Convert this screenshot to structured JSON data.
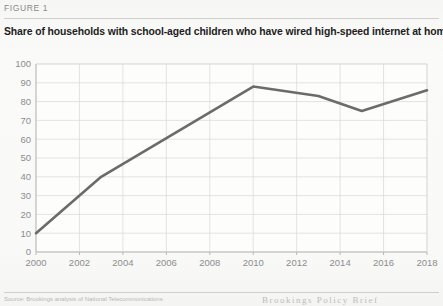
{
  "figure": {
    "label": "FIGURE 1",
    "title": "Share of households with school-aged children who have wired high-speed internet at home"
  },
  "footer": {
    "source": "Source: Brookings analysis of National Telecommunications",
    "brand": "Brookings Policy Brief"
  },
  "colors": {
    "line": "#6b6b6b",
    "grid": "#d9d9d9",
    "axis": "#b9b9b9",
    "tick_text": "#8d8d8d",
    "paper": "#f7f7f5",
    "title": "#1d1d1d"
  },
  "chart_data": {
    "type": "line",
    "title": "Share of households with school-aged children who have wired high-speed internet at home",
    "xlabel": "",
    "ylabel": "",
    "xlim": [
      2000,
      2018
    ],
    "ylim": [
      0,
      100
    ],
    "grid": true,
    "legend": "none",
    "x_ticks": [
      2000,
      2002,
      2004,
      2006,
      2008,
      2010,
      2012,
      2014,
      2016,
      2018
    ],
    "y_ticks": [
      0,
      10,
      20,
      30,
      40,
      50,
      60,
      70,
      80,
      90,
      100
    ],
    "series": [
      {
        "name": "Wired high-speed internet at home",
        "x": [
          2000,
          2003,
          2010,
          2013,
          2015,
          2018
        ],
        "values": [
          10,
          40,
          88,
          83,
          75,
          86
        ]
      }
    ]
  }
}
